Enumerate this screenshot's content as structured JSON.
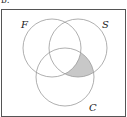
{
  "caption": "b.",
  "diagram": {
    "type": "venn",
    "sets": [
      {
        "label": "F",
        "cx": 52,
        "cy": 48,
        "r": 29,
        "label_x": 24,
        "label_y": 28
      },
      {
        "label": "S",
        "cx": 78,
        "cy": 48,
        "r": 29,
        "label_x": 102,
        "label_y": 28
      },
      {
        "label": "C",
        "cx": 65,
        "cy": 77,
        "r": 29,
        "label_x": 89,
        "label_y": 111
      }
    ],
    "shaded_region": "S ∩ C ∩ F'",
    "colors": {
      "stroke": "#9a9a9a",
      "shade": "#c8c8c8",
      "border": "#555555"
    }
  }
}
